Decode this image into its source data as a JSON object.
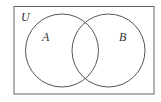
{
  "diagram": {
    "type": "venn",
    "universe_label": "U",
    "sets": [
      {
        "label": "A"
      },
      {
        "label": "B"
      }
    ],
    "colors": {
      "stroke": "#555555",
      "background": "#ffffff"
    }
  }
}
